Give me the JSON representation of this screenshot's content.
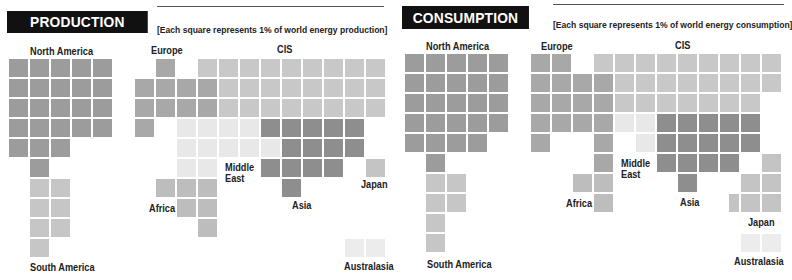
{
  "legend": {
    "colors": {
      "north_america": "#9c9c9c",
      "south_america": "#c6c6c6",
      "europe": "#a8a8a8",
      "cis": "#c8c8c8",
      "middle_east": "#e8e8e8",
      "africa": "#bdbdbd",
      "asia": "#8e8e8e",
      "japan": "#c4c4c4",
      "australasia": "#ececec"
    }
  },
  "production": {
    "title": "PRODUCTION",
    "note": "[Each square represents 1% of world energy production]",
    "labels": {
      "north_america": "North America",
      "south_america": "South America",
      "europe": "Europe",
      "cis": "CIS",
      "middle_east_1": "Middle",
      "middle_east_2": "East",
      "africa": "Africa",
      "asia": "Asia",
      "japan": "Japan",
      "australasia": "Australasia"
    }
  },
  "consumption": {
    "title": "CONSUMPTION",
    "note": "[Each square represents 1% of world energy consumption]",
    "labels": {
      "north_america": "North America",
      "south_america": "South America",
      "europe": "Europe",
      "cis": "CIS",
      "middle_east_1": "Middle",
      "middle_east_2": "East",
      "africa": "Africa",
      "asia": "Asia",
      "japan": "Japan",
      "australasia": "Australasia"
    }
  },
  "chart_data": [
    {
      "type": "waffle",
      "title": "PRODUCTION",
      "subtitle": "[Each square represents 1% of world energy production]",
      "unit": "% of world energy production (1 square = 1%)",
      "categories": [
        "North America",
        "South America",
        "Europe",
        "CIS",
        "Middle East",
        "Africa",
        "Asia",
        "Japan",
        "Australasia"
      ],
      "values": [
        24,
        7,
        10,
        25,
        13,
        6,
        14,
        1,
        2
      ],
      "layout": {
        "origin": [
          135,
          59
        ],
        "pitch": [
          21,
          20
        ],
        "na_origin": [
          9,
          59
        ],
        "cells": {
          "north_america": [
            [
              0,
              0
            ],
            [
              0,
              1
            ],
            [
              0,
              2
            ],
            [
              0,
              3
            ],
            [
              0,
              4
            ],
            [
              1,
              0
            ],
            [
              1,
              1
            ],
            [
              1,
              2
            ],
            [
              1,
              3
            ],
            [
              1,
              4
            ],
            [
              2,
              0
            ],
            [
              2,
              1
            ],
            [
              2,
              2
            ],
            [
              2,
              3
            ],
            [
              2,
              4
            ],
            [
              3,
              0
            ],
            [
              3,
              1
            ],
            [
              3,
              2
            ],
            [
              3,
              3
            ],
            [
              3,
              4
            ],
            [
              4,
              0
            ],
            [
              4,
              1
            ],
            [
              4,
              2
            ],
            [
              5,
              1
            ]
          ],
          "south_america": [
            [
              6,
              1
            ],
            [
              6,
              2
            ],
            [
              7,
              1
            ],
            [
              7,
              2
            ],
            [
              8,
              1
            ],
            [
              8,
              2
            ],
            [
              9,
              1
            ]
          ],
          "europe": [
            [
              0,
              1
            ],
            [
              1,
              0
            ],
            [
              1,
              1
            ],
            [
              1,
              2
            ],
            [
              1,
              3
            ],
            [
              2,
              0
            ],
            [
              2,
              1
            ],
            [
              2,
              2
            ],
            [
              2,
              3
            ],
            [
              3,
              0
            ]
          ],
          "cis": [
            [
              0,
              3
            ],
            [
              0,
              4
            ],
            [
              0,
              5
            ],
            [
              0,
              6
            ],
            [
              0,
              7
            ],
            [
              0,
              8
            ],
            [
              0,
              9
            ],
            [
              0,
              10
            ],
            [
              0,
              11
            ],
            [
              1,
              4
            ],
            [
              1,
              5
            ],
            [
              1,
              6
            ],
            [
              1,
              7
            ],
            [
              1,
              8
            ],
            [
              1,
              9
            ],
            [
              1,
              10
            ],
            [
              1,
              11
            ],
            [
              2,
              4
            ],
            [
              2,
              5
            ],
            [
              2,
              6
            ],
            [
              2,
              7
            ],
            [
              2,
              8
            ],
            [
              2,
              9
            ],
            [
              2,
              10
            ],
            [
              2,
              11
            ]
          ],
          "middle_east": [
            [
              3,
              2
            ],
            [
              3,
              3
            ],
            [
              3,
              4
            ],
            [
              3,
              5
            ],
            [
              4,
              2
            ],
            [
              4,
              3
            ],
            [
              4,
              4
            ],
            [
              4,
              5
            ],
            [
              4,
              6
            ],
            [
              5,
              2
            ],
            [
              5,
              3
            ]
          ],
          "africa": [
            [
              6,
              1
            ],
            [
              6,
              2
            ],
            [
              6,
              3
            ],
            [
              7,
              2
            ],
            [
              7,
              3
            ],
            [
              8,
              3
            ]
          ],
          "asia": [
            [
              3,
              6
            ],
            [
              3,
              7
            ],
            [
              3,
              8
            ],
            [
              3,
              9
            ],
            [
              3,
              10
            ],
            [
              4,
              7
            ],
            [
              4,
              8
            ],
            [
              4,
              9
            ],
            [
              4,
              10
            ],
            [
              5,
              6
            ],
            [
              5,
              7
            ],
            [
              5,
              8
            ],
            [
              5,
              9
            ],
            [
              6,
              7
            ]
          ],
          "japan": [
            [
              5,
              11
            ]
          ],
          "australasia": [
            [
              9,
              10
            ],
            [
              9,
              11
            ]
          ]
        }
      }
    },
    {
      "type": "waffle",
      "title": "CONSUMPTION",
      "subtitle": "[Each square represents 1% of world energy consumption]",
      "unit": "% of world energy consumption (1 square = 1%)",
      "categories": [
        "North America",
        "South America",
        "Europe",
        "CIS",
        "Middle East",
        "Africa",
        "Asia",
        "Japan",
        "Australasia"
      ],
      "values": [
        25,
        6,
        18,
        24,
        3,
        3,
        14,
        6,
        2
      ],
      "layout": {
        "origin": [
          531,
          54
        ],
        "pitch": [
          21,
          20
        ],
        "na_origin": [
          405,
          54
        ],
        "cells": {
          "north_america": [
            [
              0,
              0
            ],
            [
              0,
              1
            ],
            [
              0,
              2
            ],
            [
              0,
              3
            ],
            [
              0,
              4
            ],
            [
              1,
              0
            ],
            [
              1,
              1
            ],
            [
              1,
              2
            ],
            [
              1,
              3
            ],
            [
              1,
              4
            ],
            [
              2,
              0
            ],
            [
              2,
              1
            ],
            [
              2,
              2
            ],
            [
              2,
              3
            ],
            [
              2,
              4
            ],
            [
              3,
              0
            ],
            [
              3,
              1
            ],
            [
              3,
              2
            ],
            [
              3,
              3
            ],
            [
              3,
              4
            ],
            [
              4,
              0
            ],
            [
              4,
              1
            ],
            [
              4,
              2
            ],
            [
              4,
              3
            ],
            [
              5,
              1
            ]
          ],
          "south_america": [
            [
              6,
              1
            ],
            [
              6,
              2
            ],
            [
              7,
              1
            ],
            [
              7,
              2
            ],
            [
              8,
              1
            ],
            [
              9,
              1
            ]
          ],
          "europe": [
            [
              0,
              0
            ],
            [
              0,
              1
            ],
            [
              1,
              0
            ],
            [
              1,
              1
            ],
            [
              1,
              2
            ],
            [
              1,
              3
            ],
            [
              2,
              0
            ],
            [
              2,
              1
            ],
            [
              2,
              2
            ],
            [
              2,
              3
            ],
            [
              3,
              0
            ],
            [
              3,
              1
            ],
            [
              3,
              2
            ],
            [
              3,
              3
            ],
            [
              4,
              0
            ],
            [
              4,
              3
            ],
            [
              5,
              3
            ]
          ],
          "cis": [
            [
              0,
              3
            ],
            [
              0,
              4
            ],
            [
              0,
              5
            ],
            [
              0,
              6
            ],
            [
              0,
              7
            ],
            [
              0,
              8
            ],
            [
              0,
              9
            ],
            [
              0,
              10
            ],
            [
              0,
              11
            ],
            [
              1,
              4
            ],
            [
              1,
              5
            ],
            [
              1,
              6
            ],
            [
              1,
              7
            ],
            [
              1,
              8
            ],
            [
              1,
              9
            ],
            [
              1,
              10
            ],
            [
              1,
              11
            ],
            [
              2,
              4
            ],
            [
              2,
              5
            ],
            [
              2,
              6
            ],
            [
              2,
              7
            ],
            [
              2,
              8
            ],
            [
              2,
              9
            ],
            [
              2,
              10
            ]
          ],
          "middle_east": [
            [
              3,
              4
            ],
            [
              3,
              5
            ],
            [
              4,
              5
            ]
          ],
          "africa": [
            [
              6,
              2
            ],
            [
              6,
              3
            ],
            [
              7,
              3
            ]
          ],
          "asia": [
            [
              3,
              6
            ],
            [
              3,
              7
            ],
            [
              3,
              8
            ],
            [
              3,
              9
            ],
            [
              3,
              10
            ],
            [
              4,
              6
            ],
            [
              4,
              7
            ],
            [
              4,
              8
            ],
            [
              4,
              9
            ],
            [
              4,
              10
            ],
            [
              5,
              6
            ],
            [
              5,
              7
            ],
            [
              5,
              8
            ],
            [
              5,
              9
            ],
            [
              6,
              7
            ]
          ],
          "japan": [
            [
              5,
              11
            ],
            [
              6,
              10
            ],
            [
              6,
              11
            ],
            [
              7,
              9.4
            ],
            [
              7,
              10
            ],
            [
              7,
              11
            ]
          ],
          "australasia": [
            [
              9,
              10
            ],
            [
              9,
              11
            ]
          ]
        }
      }
    }
  ]
}
